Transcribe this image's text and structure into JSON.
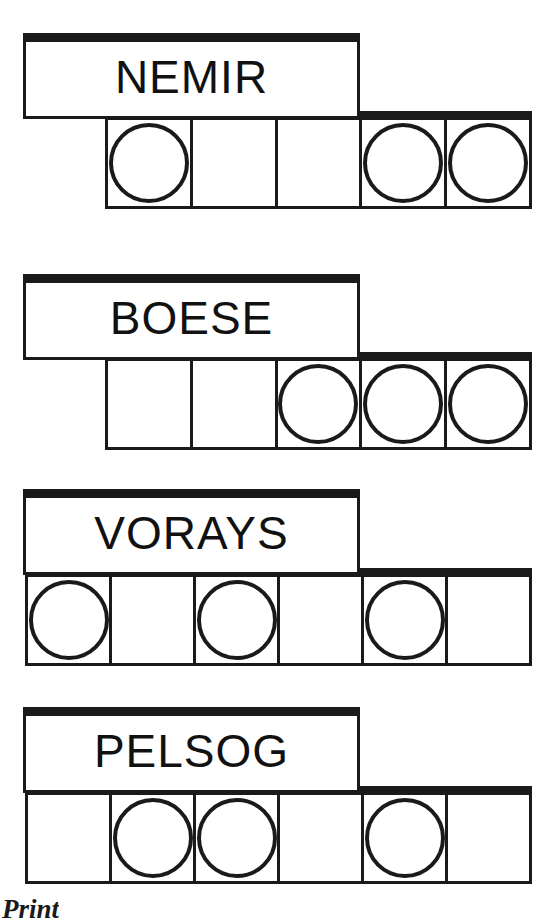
{
  "page": {
    "background_color": "#ffffff",
    "ink_color": "#1a1a1a",
    "width": 555,
    "height": 919
  },
  "footer": {
    "caption": "Print"
  },
  "exercises": [
    {
      "id": "nemir",
      "word": "NEMIR",
      "cell_count": 5,
      "cells": [
        {
          "index": 1,
          "marked": true
        },
        {
          "index": 2,
          "marked": false
        },
        {
          "index": 3,
          "marked": false
        },
        {
          "index": 4,
          "marked": true
        },
        {
          "index": 5,
          "marked": true
        }
      ],
      "layout": {
        "word_box": {
          "x": 23,
          "y": 33,
          "w": 337,
          "h": 86
        },
        "word_text_y": 40,
        "cell_row": {
          "x": 105,
          "y": 111,
          "w": 427,
          "h": 98
        },
        "dot_size": 80
      }
    },
    {
      "id": "boese",
      "word": "BOESE",
      "cell_count": 5,
      "cells": [
        {
          "index": 1,
          "marked": false
        },
        {
          "index": 2,
          "marked": false
        },
        {
          "index": 3,
          "marked": true
        },
        {
          "index": 4,
          "marked": true
        },
        {
          "index": 5,
          "marked": true
        }
      ],
      "layout": {
        "word_box": {
          "x": 23,
          "y": 274,
          "w": 337,
          "h": 86
        },
        "word_text_y": 281,
        "cell_row": {
          "x": 105,
          "y": 352,
          "w": 427,
          "h": 98
        },
        "dot_size": 80
      }
    },
    {
      "id": "vorays",
      "word": "VORAYS",
      "cell_count": 6,
      "cells": [
        {
          "index": 1,
          "marked": true
        },
        {
          "index": 2,
          "marked": false
        },
        {
          "index": 3,
          "marked": true
        },
        {
          "index": 4,
          "marked": false
        },
        {
          "index": 5,
          "marked": true
        },
        {
          "index": 6,
          "marked": false
        }
      ],
      "layout": {
        "word_box": {
          "x": 23,
          "y": 489,
          "w": 337,
          "h": 86
        },
        "word_text_y": 496,
        "cell_row": {
          "x": 25,
          "y": 568,
          "w": 507,
          "h": 98
        },
        "dot_size": 80
      }
    },
    {
      "id": "pelsog",
      "word": "PELSOG",
      "cell_count": 6,
      "cells": [
        {
          "index": 1,
          "marked": false
        },
        {
          "index": 2,
          "marked": true
        },
        {
          "index": 3,
          "marked": true
        },
        {
          "index": 4,
          "marked": false
        },
        {
          "index": 5,
          "marked": true
        },
        {
          "index": 6,
          "marked": false
        }
      ],
      "layout": {
        "word_box": {
          "x": 23,
          "y": 707,
          "w": 337,
          "h": 86
        },
        "word_text_y": 714,
        "cell_row": {
          "x": 25,
          "y": 786,
          "w": 507,
          "h": 98
        },
        "dot_size": 80
      }
    }
  ]
}
